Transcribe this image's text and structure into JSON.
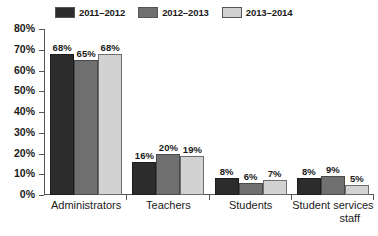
{
  "chart_data": {
    "type": "bar",
    "title": "",
    "subtitle": "",
    "xlabel": "",
    "ylabel": "",
    "ylim": [
      0,
      80
    ],
    "grid": false,
    "legend_position": "top-left",
    "y_ticks": [
      "0%",
      "10%",
      "20%",
      "30%",
      "40%",
      "50%",
      "60%",
      "70%",
      "80%"
    ],
    "y_tick_values": [
      0,
      10,
      20,
      30,
      40,
      50,
      60,
      70,
      80
    ],
    "categories": [
      "Administrators",
      "Teachers",
      "Students",
      "Student services staff"
    ],
    "category_lines": [
      [
        "Administrators"
      ],
      [
        "Teachers"
      ],
      [
        "Students"
      ],
      [
        "Student services",
        "staff"
      ]
    ],
    "series": [
      {
        "name": "2011–2012",
        "color": "#2c2c2c",
        "values": [
          68,
          16,
          8,
          8
        ],
        "labels": [
          "68%",
          "16%",
          "8%",
          "8%"
        ]
      },
      {
        "name": "2012–2013",
        "color": "#6f6f6f",
        "values": [
          65,
          20,
          6,
          9
        ],
        "labels": [
          "65%",
          "20%",
          "6%",
          "9%"
        ]
      },
      {
        "name": "2013–2014",
        "color": "#d2d2d2",
        "values": [
          68,
          19,
          7,
          5
        ],
        "labels": [
          "68%",
          "19%",
          "7%",
          "5%"
        ]
      }
    ]
  },
  "legend": {
    "items": [
      {
        "label": "2011–2012",
        "color": "#2c2c2c"
      },
      {
        "label": "2012–2013",
        "color": "#6f6f6f"
      },
      {
        "label": "2013–2014",
        "color": "#d2d2d2"
      }
    ]
  },
  "colors": {
    "background": "#ffffff",
    "axis": "#555555",
    "text": "#1a1a1a",
    "series_1": "#2c2c2c",
    "series_2": "#6f6f6f",
    "series_3": "#d2d2d2"
  }
}
